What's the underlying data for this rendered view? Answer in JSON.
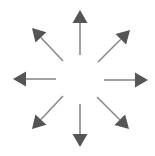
{
  "diagram": {
    "title": "",
    "type": "radial-arrows",
    "center": [
      80,
      79
    ],
    "colors": {
      "shaft": "#8a8a8a",
      "head": "#555555",
      "background": "#ffffff"
    },
    "arrows": [
      {
        "direction": "up",
        "from": [
          80,
          55
        ],
        "to": [
          80,
          10
        ]
      },
      {
        "direction": "up-right",
        "from": [
          98,
          62
        ],
        "to": [
          130,
          30
        ]
      },
      {
        "direction": "right",
        "from": [
          104,
          80
        ],
        "to": [
          148,
          80
        ]
      },
      {
        "direction": "down-right",
        "from": [
          97,
          97
        ],
        "to": [
          129,
          129
        ]
      },
      {
        "direction": "down",
        "from": [
          80,
          104
        ],
        "to": [
          80,
          147
        ]
      },
      {
        "direction": "down-left",
        "from": [
          63,
          96
        ],
        "to": [
          32,
          129
        ]
      },
      {
        "direction": "left",
        "from": [
          56,
          79
        ],
        "to": [
          13,
          79
        ]
      },
      {
        "direction": "up-left",
        "from": [
          63,
          61
        ],
        "to": [
          32,
          28
        ]
      }
    ]
  }
}
